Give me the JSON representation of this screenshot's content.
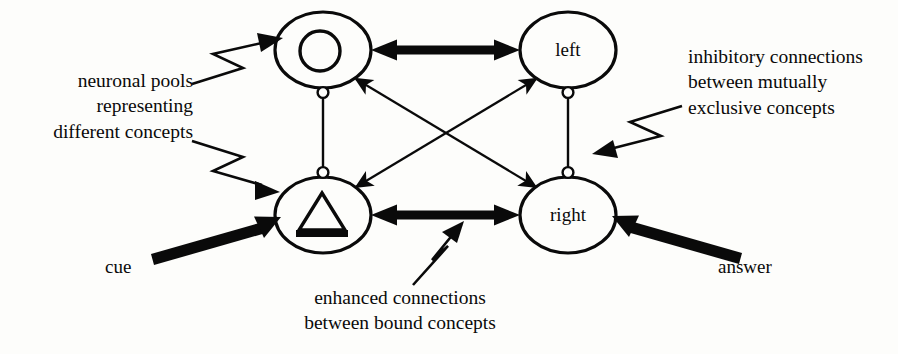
{
  "figure": {
    "background_color": "#fdfdfb",
    "ink_color": "#0a0a0a"
  },
  "nodes": [
    {
      "id": "moon-pool",
      "label": "",
      "glyph": "crescent-moon-icon",
      "cx": 323,
      "cy": 50,
      "rx": 48,
      "ry": 38
    },
    {
      "id": "left-pool",
      "label": "left",
      "glyph": "text",
      "cx": 568,
      "cy": 50,
      "rx": 48,
      "ry": 38
    },
    {
      "id": "triangle-pool",
      "label": "",
      "glyph": "triangle-icon",
      "cx": 323,
      "cy": 215,
      "rx": 48,
      "ry": 38
    },
    {
      "id": "right-pool",
      "label": "right",
      "glyph": "text",
      "cx": 568,
      "cy": 215,
      "rx": 48,
      "ry": 38
    }
  ],
  "annotations": {
    "neuronal_pools": {
      "lines": [
        "neuronal pools",
        "representing",
        "different concepts"
      ],
      "text": "neuronal pools\nrepresenting\ndifferent concepts"
    },
    "inhibitory": {
      "lines": [
        "inhibitory connections",
        "between mutually",
        "exclusive concepts"
      ],
      "text": "inhibitory connections\nbetween mutually\nexclusive concepts"
    },
    "enhanced": {
      "lines": [
        "enhanced connections",
        "between bound concepts"
      ],
      "text": "enhanced connections\nbetween bound concepts"
    }
  },
  "io": {
    "cue_label": "cue",
    "answer_label": "answer"
  },
  "connections": [
    {
      "name": "moon-left-excitatory",
      "type": "thick-double-arrow",
      "from": "moon-pool",
      "to": "left-pool"
    },
    {
      "name": "triangle-right-excitatory",
      "type": "thick-double-arrow",
      "from": "triangle-pool",
      "to": "right-pool"
    },
    {
      "name": "moon-right-diagonal",
      "type": "thin-double-arrow",
      "from": "moon-pool",
      "to": "right-pool"
    },
    {
      "name": "left-triangle-diagonal",
      "type": "thin-double-arrow",
      "from": "left-pool",
      "to": "triangle-pool"
    },
    {
      "name": "moon-triangle-inhibitory",
      "type": "inhibitory-ball-line",
      "from": "moon-pool",
      "to": "triangle-pool"
    },
    {
      "name": "left-right-inhibitory",
      "type": "inhibitory-ball-line",
      "from": "left-pool",
      "to": "right-pool"
    },
    {
      "name": "cue-input",
      "type": "thick-arrow",
      "from": "cue",
      "to": "triangle-pool"
    },
    {
      "name": "answer-input",
      "type": "thick-arrow",
      "from": "answer",
      "to": "right-pool"
    }
  ]
}
